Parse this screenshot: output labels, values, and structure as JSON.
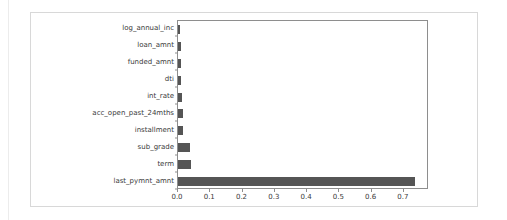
{
  "chart_data": {
    "type": "bar",
    "orientation": "horizontal",
    "title": "",
    "xlabel": "",
    "ylabel": "",
    "categories": [
      "log_annual_inc",
      "loan_amnt",
      "funded_amnt",
      "dti",
      "int_rate",
      "acc_open_past_24mths",
      "installment",
      "sub_grade",
      "term",
      "last_pymnt_amnt"
    ],
    "values": [
      0.005,
      0.008,
      0.009,
      0.009,
      0.012,
      0.014,
      0.017,
      0.038,
      0.039,
      0.735
    ],
    "xlim": [
      0.0,
      0.778
    ],
    "ylim_categories_top_to_bottom": true,
    "xticks": [
      0.0,
      0.1,
      0.2,
      0.3,
      0.4,
      0.5,
      0.6,
      0.7
    ],
    "xticklabels": [
      "0.0",
      "0.1",
      "0.2",
      "0.3",
      "0.4",
      "0.5",
      "0.6",
      "0.7"
    ],
    "grid": false,
    "legend": false,
    "bar_color": "#555555",
    "axes_color": "#8e8e8e",
    "text_color": "#3a3a3a",
    "background_color": "#ffffff",
    "card_border_color": "#d8d8d8"
  }
}
